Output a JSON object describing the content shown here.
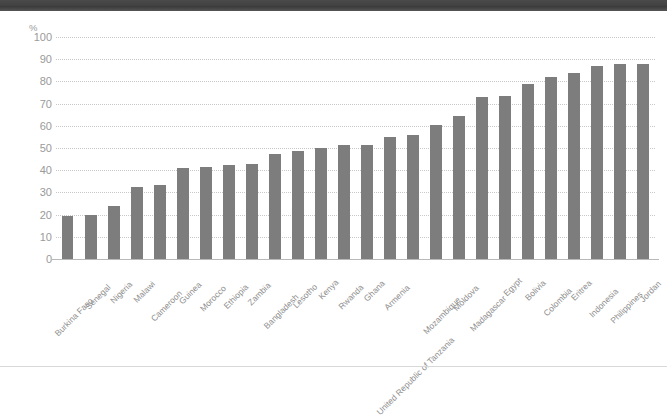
{
  "window": {
    "titlebar_text": ""
  },
  "chart_data": {
    "type": "bar",
    "title": "",
    "subtitle": "",
    "xlabel": "",
    "ylabel": "%",
    "ylim": [
      0,
      100
    ],
    "ytick_step": 10,
    "yticks": [
      "100",
      "90",
      "80",
      "70",
      "60",
      "50",
      "40",
      "30",
      "20",
      "10",
      "0"
    ],
    "grid": true,
    "legend": "none",
    "bar_color": "#7d7d7d",
    "gridline_color": "#c9c9c9",
    "axis_text_color": "#9a9a9a",
    "categories": [
      "Burkina Faso",
      "Senegal",
      "Nigeria",
      "Malawi",
      "Cameroon",
      "Guinea",
      "Morocco",
      "Ethiopia",
      "Zambia",
      "Bangladesh",
      "Lesotho",
      "Kenya",
      "Rwanda",
      "Ghana",
      "Armenia",
      "United Republic of Tanzania",
      "Mozambique",
      "Moldova",
      "Madagascar",
      "Egypt",
      "Bolivia",
      "Colombia",
      "Eritrea",
      "Indonesia",
      "Philippines",
      "Jordan"
    ],
    "values": [
      19.5,
      20,
      24,
      32.5,
      33.5,
      41,
      41.5,
      42.5,
      43,
      47.5,
      48.5,
      50,
      51.5,
      51.5,
      55,
      56,
      60.5,
      64.5,
      73,
      73.5,
      79,
      82,
      84,
      87,
      88,
      88
    ]
  }
}
